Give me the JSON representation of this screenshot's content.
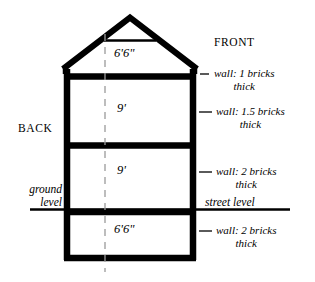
{
  "diagram": {
    "orientation": {
      "front_label": "FRONT",
      "back_label": "BACK"
    },
    "levels": [
      {
        "name": "attic",
        "height": "6'6\""
      },
      {
        "name": "upper-floor",
        "height": "9'"
      },
      {
        "name": "ground-floor",
        "height": "9'"
      },
      {
        "name": "basement",
        "height": "6'6\""
      }
    ],
    "wall_notes": [
      {
        "id": "attic-wall",
        "line1": "wall: 1 bricks",
        "line2": "thick"
      },
      {
        "id": "upper-floor-wall",
        "line1": "wall: 1.5 bricks",
        "line2": "thick"
      },
      {
        "id": "ground-floor-wall",
        "line1": "wall: 2 bricks",
        "line2": "thick"
      },
      {
        "id": "basement-wall",
        "line1": "wall: 2 bricks",
        "line2": "thick"
      }
    ],
    "grade_labels": {
      "ground_level_line1": "ground",
      "ground_level_line2": "level",
      "street_level": "street level"
    },
    "colors": {
      "stroke": "#000000",
      "background": "#ffffff",
      "centerline": "#9a9a9a"
    }
  }
}
